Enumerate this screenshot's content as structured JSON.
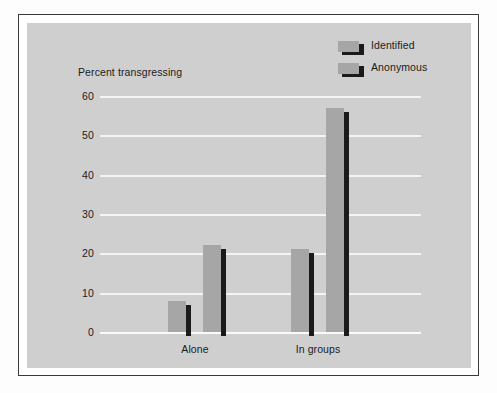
{
  "chart_data": {
    "type": "bar",
    "title": "",
    "subtitle": "",
    "xlabel": "",
    "ylabel": "Percent transgressing",
    "categories": [
      "Alone",
      "In groups"
    ],
    "series": [
      {
        "name": "Identified",
        "values": [
          8,
          21
        ],
        "color": "#a6a6a6"
      },
      {
        "name": "Anonymous",
        "values": [
          22,
          57
        ],
        "color": "#a6a6a6"
      }
    ],
    "ylim": [
      0,
      60
    ],
    "ytick_labels": [
      "60",
      "50",
      "40",
      "30",
      "20",
      "10",
      "0"
    ],
    "ytick_values": [
      60,
      50,
      40,
      30,
      20,
      10,
      0
    ],
    "grid": true,
    "grid_color": "#f4f4f4",
    "legend_position": "top-right",
    "plot_background": "#cfcfcf",
    "bar_shadow_color": "#1a1a1a",
    "annotations": []
  },
  "axes": {
    "y_label": "Percent transgressing",
    "y_ticks": [
      {
        "label": "60"
      },
      {
        "label": "50"
      },
      {
        "label": "40"
      },
      {
        "label": "30"
      },
      {
        "label": "20"
      },
      {
        "label": "10"
      },
      {
        "label": "0"
      }
    ],
    "x_ticks": [
      {
        "label": "Alone"
      },
      {
        "label": "In groups"
      }
    ]
  },
  "legend": {
    "items": [
      {
        "label": "Identified",
        "swatch": "gray-bar-swatch"
      },
      {
        "label": "Anonymous",
        "swatch": "gray-bar-swatch"
      }
    ]
  }
}
